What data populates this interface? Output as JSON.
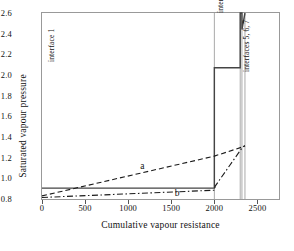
{
  "chart_data": {
    "type": "line",
    "title": "",
    "xlabel": "Cumulative vapour resistance",
    "ylabel": "Saturated vapour pressure",
    "xlim": [
      0,
      2750
    ],
    "ylim": [
      0.8,
      2.6
    ],
    "xticks": [
      0,
      500,
      1000,
      1500,
      2000,
      2500
    ],
    "xtick_labels": [
      "0",
      "500",
      "1000",
      "1500",
      "2000",
      "2500"
    ],
    "yticks": [
      0.8,
      1.0,
      1.2,
      1.4,
      1.6,
      1.8,
      2.0,
      2.2,
      2.4,
      2.6
    ],
    "ytick_labels": [
      "0.8",
      "1.0",
      "1.2",
      "1.4",
      "1.6",
      "1.8",
      "2.0",
      "2.2",
      "2.4",
      "2.6"
    ],
    "grid": false,
    "legend": "inline-annotations",
    "series": [
      {
        "name": "saturated vapour pressure",
        "style": "solid",
        "color": "#444444",
        "points": [
          [
            0,
            0.905
          ],
          [
            2000,
            0.905
          ],
          [
            2000,
            2.07
          ],
          [
            2300,
            2.07
          ],
          [
            2300,
            2.6
          ],
          [
            2320,
            2.6
          ],
          [
            2320,
            2.44
          ],
          [
            2355,
            2.6
          ]
        ]
      },
      {
        "name": "a",
        "style": "dashed",
        "color": "#1a1a1a",
        "points": [
          [
            0,
            0.83
          ],
          [
            2000,
            1.215
          ],
          [
            2330,
            1.305
          ],
          [
            2355,
            1.315
          ]
        ]
      },
      {
        "name": "b",
        "style": "dash-dot",
        "color": "#1a1a1a",
        "points": [
          [
            0,
            0.815
          ],
          [
            2000,
            0.885
          ],
          [
            2010,
            0.925
          ],
          [
            2330,
            1.305
          ],
          [
            2355,
            1.315
          ]
        ]
      }
    ],
    "interfaces": [
      {
        "label": "interface 1",
        "x": 30,
        "text_y": 2.13
      },
      {
        "label": "interfaces 2,3,4",
        "x": 2000,
        "text_y": 2.6
      },
      {
        "label": "interfaces 5, 6, 7",
        "x": 2300,
        "text_y": 2.03
      }
    ],
    "interface_lines_x": [
      2000,
      2300,
      2320,
      2355
    ],
    "curve_labels": [
      {
        "label": "a",
        "x": 1140,
        "y": 1.105
      },
      {
        "label": "b",
        "x": 1540,
        "y": 0.845
      }
    ]
  },
  "axes": {
    "x_title": "Cumulative vapour resistance",
    "y_title": "Saturated vapour pressure",
    "x_ticks": [
      "0",
      "500",
      "1000",
      "1500",
      "2000",
      "2500"
    ],
    "y_ticks": [
      "2.6",
      "2.4",
      "2.2",
      "2.0",
      "1.8",
      "1.6",
      "1.4",
      "1.2",
      "1.0",
      "0.8"
    ]
  },
  "annotations": {
    "interface_1": "interface 1",
    "interfaces_234": "interfaces 2,3,4",
    "interfaces_567": "interfaces 5, 6, 7",
    "curve_a": "a",
    "curve_b": "b"
  },
  "colors": {
    "frame": "#999999",
    "solid_line": "#444444",
    "dashed_line": "#1a1a1a",
    "interface_line": "#aaaaaa",
    "text": "#111111"
  }
}
